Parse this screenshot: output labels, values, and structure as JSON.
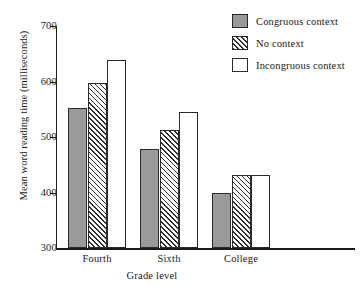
{
  "chart_data": {
    "type": "bar",
    "title": "",
    "xlabel": "Grade level",
    "ylabel": "Mean word reading time (milliseconds)",
    "categories": [
      "Fourth",
      "Sixth",
      "College"
    ],
    "series": [
      {
        "name": "Congruous context",
        "values": [
          553,
          478,
          400
        ],
        "fill": "solid"
      },
      {
        "name": "No context",
        "values": [
          598,
          512,
          431
        ],
        "fill": "hatch"
      },
      {
        "name": "Incongruous context",
        "values": [
          639,
          545,
          431
        ],
        "fill": "open"
      }
    ],
    "ylim": [
      300,
      700
    ],
    "yticks": [
      300,
      400,
      500,
      600,
      700
    ],
    "ytick_labels": [
      "300",
      "400",
      "500",
      "600",
      "700"
    ],
    "grid": false,
    "legend_position": "top-right",
    "colors": {
      "solid_fill": "#9a9a9a",
      "hatch_line": "#2f2f2f",
      "open_fill": "#ffffff",
      "outline": "#2a2a2a",
      "axis": "#1a1a1a",
      "background": "#ffffff"
    }
  }
}
